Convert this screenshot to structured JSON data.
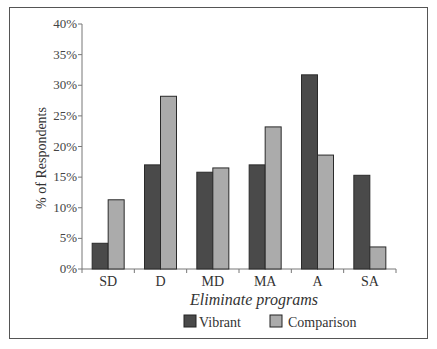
{
  "chart_data": {
    "type": "bar",
    "title": "",
    "xlabel": "Eliminate programs",
    "ylabel": "% of Respondents",
    "categories": [
      "SD",
      "D",
      "MD",
      "MA",
      "A",
      "SA"
    ],
    "series": [
      {
        "name": "Vibrant",
        "color": "#4a4a4a",
        "values": [
          4.2,
          17.0,
          15.8,
          17.0,
          31.7,
          15.3
        ]
      },
      {
        "name": "Comparison",
        "color": "#ababab",
        "values": [
          11.3,
          28.2,
          16.5,
          23.2,
          18.6,
          3.6
        ]
      }
    ],
    "ylim": [
      0,
      40
    ],
    "yticks": [
      "0%",
      "5%",
      "10%",
      "15%",
      "20%",
      "25%",
      "30%",
      "35%",
      "40%"
    ],
    "ytick_values": [
      0,
      5,
      10,
      15,
      20,
      25,
      30,
      35,
      40
    ],
    "grid": false,
    "legend_position": "bottom"
  },
  "legend": {
    "items": [
      {
        "label": "Vibrant",
        "color": "#4a4a4a"
      },
      {
        "label": "Comparison",
        "color": "#ababab"
      }
    ]
  }
}
